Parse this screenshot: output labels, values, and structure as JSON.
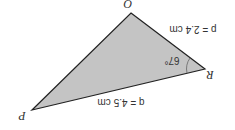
{
  "diagram": {
    "orientation": "rotated 180 degrees",
    "vertices": [
      {
        "name": "Q",
        "x": 131,
        "y": 13,
        "label_x": 128,
        "label_y": 8
      },
      {
        "name": "R",
        "x": 205,
        "y": 69,
        "label_x": 210,
        "label_y": 78
      },
      {
        "name": "P",
        "x": 32,
        "y": 110,
        "label_x": 24,
        "label_y": 120
      }
    ],
    "fill_color": "#c4c4c4",
    "stroke_color": "#222222",
    "labels": {
      "Q": "Q",
      "R": "R",
      "P": "P",
      "side_p": "p = 2.4 cm",
      "side_q": "q = 4.5 cm",
      "angle_R": "67°"
    }
  }
}
